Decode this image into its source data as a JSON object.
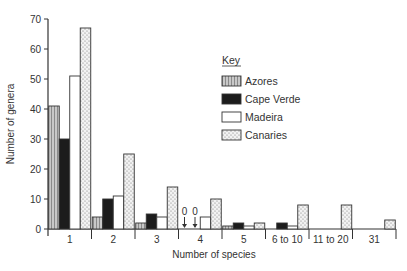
{
  "chart_data": {
    "type": "bar",
    "title": "",
    "xlabel": "Number of species",
    "ylabel": "Number of genera",
    "ylim": [
      0,
      70
    ],
    "yticks": [
      0,
      10,
      20,
      30,
      40,
      50,
      60,
      70
    ],
    "grid": false,
    "legend_position": "upper right",
    "legend_title": "Key",
    "categories": [
      "1",
      "2",
      "3",
      "4",
      "5",
      "6 to 10",
      "11 to 20",
      "31"
    ],
    "series": [
      {
        "name": "Azores",
        "pattern": "fine-grey-hatch",
        "values": [
          41,
          4,
          2,
          0,
          1,
          0,
          0,
          0
        ]
      },
      {
        "name": "Cape Verde",
        "pattern": "solid-black",
        "values": [
          30,
          10,
          5,
          0,
          2,
          2,
          0,
          0
        ]
      },
      {
        "name": "Madeira",
        "pattern": "white",
        "values": [
          51,
          11,
          4,
          4,
          1,
          1,
          0,
          0
        ]
      },
      {
        "name": "Canaries",
        "pattern": "stipple",
        "values": [
          67,
          25,
          14,
          10,
          2,
          8,
          8,
          3
        ]
      }
    ],
    "annotations": [
      {
        "category": "4",
        "series": "Azores",
        "text": "0",
        "arrow": "down"
      },
      {
        "category": "4",
        "series": "Cape Verde",
        "text": "0",
        "arrow": "down"
      }
    ]
  }
}
